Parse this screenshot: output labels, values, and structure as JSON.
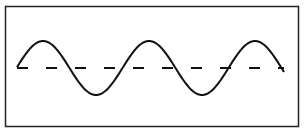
{
  "diagram": {
    "type": "waveform",
    "frame": {
      "x": 5,
      "y": 6,
      "width": 294,
      "height": 121,
      "stroke": "#222222"
    },
    "baseline": {
      "y": 68,
      "x_start": 17,
      "x_end": 284,
      "dash": "15 18",
      "stroke": "#111111"
    },
    "wave": {
      "x_start": 17,
      "x_end": 284,
      "center_y": 68,
      "amplitude": 27,
      "period": 106,
      "cycles": 2.5,
      "peaks_x": [
        43,
        149,
        255
      ],
      "troughs_x": [
        96,
        202
      ],
      "stroke": "#111111"
    }
  }
}
